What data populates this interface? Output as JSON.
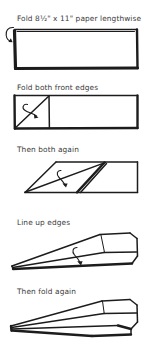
{
  "document": {
    "title": "Paper airplane folding instructions",
    "background_color": "#ffffff",
    "ink_color": "#1c1c1c",
    "text_color": "#3a3a3a",
    "width": 160,
    "height": 350
  },
  "steps": [
    {
      "number": 1,
      "caption": "Fold 8½\" x 11\" paper lengthwise",
      "figure_name": "flat-rectangle-sheet",
      "arrow": "curved-fold-arrow-left"
    },
    {
      "number": 2,
      "caption": "Fold both front edges",
      "figure_name": "rectangle-with-diagonal-crease",
      "arrow": "curved-fold-arrow-center"
    },
    {
      "number": 3,
      "caption": "Then both again",
      "figure_name": "angled-fold-parallelogram",
      "arrow": "curved-fold-arrow-down"
    },
    {
      "number": 4,
      "caption": "Line up edges",
      "figure_name": "airplane-profile-open",
      "arrow": "curved-fold-arrow-down"
    },
    {
      "number": 5,
      "caption": "Then fold again",
      "figure_name": "airplane-profile-finished",
      "arrow": "none"
    }
  ]
}
